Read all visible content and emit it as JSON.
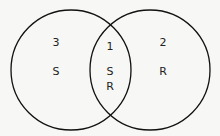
{
  "diagram": {
    "type": "venn",
    "stroke_color": "#111111",
    "background": "#f7f7f5",
    "sets": [
      {
        "name": "S",
        "count_label": "3",
        "set_label": "S",
        "region": "left-only"
      },
      {
        "name": "R",
        "count_label": "2",
        "set_label": "R",
        "region": "right-only"
      }
    ],
    "intersection": {
      "count_label": "1",
      "labels": [
        "S",
        "R"
      ]
    }
  }
}
